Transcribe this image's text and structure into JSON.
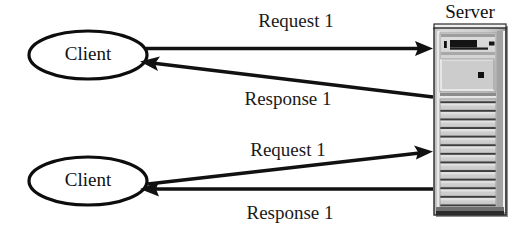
{
  "diagram": {
    "background_color": "#ffffff",
    "line_color": "#111111",
    "text_color": "#111111",
    "width": 517,
    "height": 239,
    "server": {
      "label": "Server",
      "icon_name": "server-tower-icon",
      "body_fill_top": "#d6d6d6",
      "body_fill_bottom": "#bdbdbd",
      "outline_color": "#2a2a2a",
      "drive_slot_color": "#111111",
      "vent_count": 14
    },
    "clients": [
      {
        "label": "Client",
        "position": "top"
      },
      {
        "label": "Client",
        "position": "bottom"
      }
    ],
    "flows": [
      {
        "id": "top-request",
        "label": "Request 1",
        "direction": "client-to-server",
        "shape": "horizontal"
      },
      {
        "id": "top-response",
        "label": "Response 1",
        "direction": "server-to-client",
        "shape": "diagonal"
      },
      {
        "id": "bottom-request",
        "label": "Request 1",
        "direction": "client-to-server",
        "shape": "diagonal"
      },
      {
        "id": "bottom-response",
        "label": "Response 1",
        "direction": "server-to-client",
        "shape": "horizontal"
      }
    ]
  }
}
